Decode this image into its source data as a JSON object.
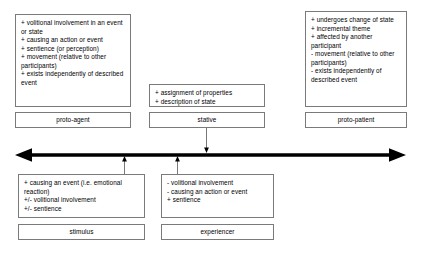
{
  "diagram": {
    "axis": {
      "name": "proto-agent / proto-patient continuum",
      "left_arrow": "arrowhead-left",
      "right_arrow": "arrowhead-right"
    },
    "nodes": [
      {
        "id": "proto-agent",
        "label": "proto-agent",
        "features": [
          "+ volitional involvement in an event or state",
          "+ causing an action or event",
          "+ sentience (or perception)",
          "+ movement (relative to other participants)",
          "+ exists independently of described event"
        ]
      },
      {
        "id": "stative",
        "label": "stative",
        "features": [
          "+ assignment of properties",
          "+ description of state"
        ]
      },
      {
        "id": "proto-patient",
        "label": "proto-patient",
        "features": [
          "+ undergoes change of state",
          "+ incremental theme",
          "+ affected by another participant",
          "- movement (relative to other participants)",
          "- exists independently of described event"
        ]
      },
      {
        "id": "stimulus",
        "label": "stimulus",
        "features": [
          "+ causing an event (i.e. emotional reaction)",
          "+/- volitional involvement",
          "+/- sentience"
        ]
      },
      {
        "id": "experiencer",
        "label": "experiencer",
        "features": [
          "- volitional involvement",
          "- causing an action or event",
          "+ sentience"
        ]
      }
    ],
    "connectors": [
      {
        "id": "stative-to-axis",
        "from": "stative",
        "to": "axis",
        "direction": "down"
      },
      {
        "id": "stimulus-to-axis",
        "from": "stimulus",
        "to": "axis",
        "direction": "up"
      },
      {
        "id": "experiencer-to-axis",
        "from": "experiencer",
        "to": "axis",
        "direction": "up"
      }
    ],
    "colors": {
      "background": "#ffffff",
      "box_border": "#7a7a7a",
      "text": "#000000",
      "axis": "#000000"
    }
  }
}
